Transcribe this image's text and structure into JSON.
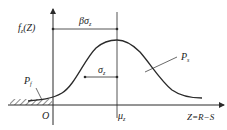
{
  "diagram": {
    "labels": {
      "y_axis": "f",
      "y_axis_sub": "z",
      "y_axis_arg": "(Z)",
      "beta_sigma": "βσ",
      "beta_sigma_sub": "z",
      "sigma": "σ",
      "sigma_sub": "z",
      "p_s": "P",
      "p_s_sub": "s",
      "p_f": "P",
      "p_f_sub": "f",
      "origin": "O",
      "mu": "μ",
      "mu_sub": "z",
      "x_axis": "Z=R−S"
    },
    "colors": {
      "stroke": "#2a2a2a",
      "text": "#222222",
      "background": "#ffffff"
    }
  }
}
